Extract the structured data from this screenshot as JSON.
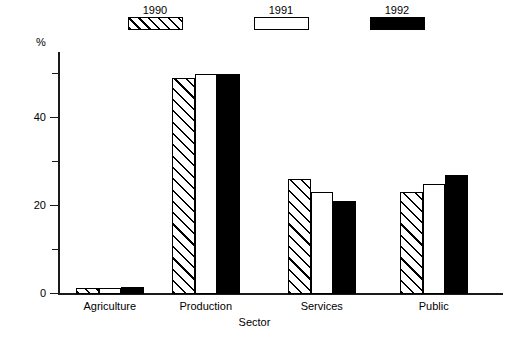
{
  "chart_data": {
    "type": "bar",
    "title": "",
    "xlabel": "Sector",
    "ylabel": "%",
    "categories": [
      "Agriculture",
      "Production",
      "Services",
      "Public"
    ],
    "series": [
      {
        "name": "1990",
        "pattern": "hatched",
        "color": "#ffffff",
        "values": [
          1.3,
          49,
          26,
          23
        ]
      },
      {
        "name": "1991",
        "pattern": "open",
        "color": "#ffffff",
        "values": [
          1.3,
          50,
          23,
          25
        ]
      },
      {
        "name": "1992",
        "pattern": "solid",
        "color": "#000000",
        "values": [
          1.5,
          50,
          21,
          27
        ]
      }
    ],
    "ylim": [
      0,
      55
    ],
    "yticks": [
      0,
      20,
      40
    ],
    "yticks_minor": [
      10,
      30,
      50
    ],
    "ytick_labels": [
      "0",
      "20",
      "40"
    ],
    "grid": false,
    "legend_position": "top"
  },
  "legend": {
    "entries": [
      {
        "label": "1990",
        "swatch": "hatched-swatch"
      },
      {
        "label": "1991",
        "swatch": "open-swatch"
      },
      {
        "label": "1992",
        "swatch": "solid-swatch"
      }
    ]
  },
  "axes": {
    "y_axis_label": "%",
    "x_axis_label": "Sector",
    "tick_0": "0",
    "tick_20": "20",
    "tick_40": "40"
  },
  "categories": {
    "c0": "Agriculture",
    "c1": "Production",
    "c2": "Services",
    "c3": "Public"
  }
}
